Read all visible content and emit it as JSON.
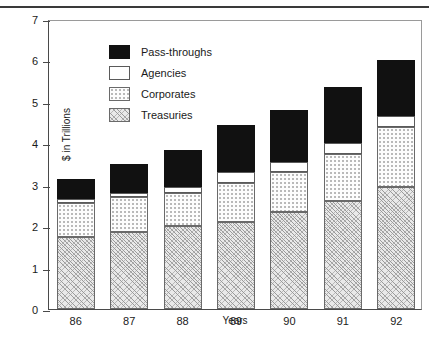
{
  "chart_data": {
    "type": "bar",
    "subtype": "stacked-bar",
    "title": "",
    "xlabel": "Years",
    "ylabel": "$ in Trillions",
    "categories": [
      "86",
      "87",
      "88",
      "89",
      "90",
      "91",
      "92"
    ],
    "ylim": [
      0,
      7
    ],
    "yticks": [
      0,
      1,
      2,
      3,
      4,
      5,
      6,
      7
    ],
    "ytick_labels": [
      "0",
      "1",
      "2",
      "3",
      "4",
      "5",
      "6",
      "7"
    ],
    "grid": false,
    "legend_position": "upper-left-inside",
    "stack_order_bottom_to_top": [
      "Treasuries",
      "Corporates",
      "Agencies",
      "Pass-throughs"
    ],
    "series": [
      {
        "name": "Treasuries",
        "fill": "diagonal-hatch",
        "color": "#e9e9e9",
        "values": [
          1.75,
          1.85,
          2.0,
          2.1,
          2.35,
          2.6,
          2.95
        ]
      },
      {
        "name": "Corporates",
        "fill": "light-dotted",
        "color": "#fdfdfd",
        "values": [
          0.8,
          0.85,
          0.8,
          0.95,
          0.95,
          1.15,
          1.45
        ]
      },
      {
        "name": "Agencies",
        "fill": "solid-white",
        "color": "#ffffff",
        "values": [
          0.1,
          0.1,
          0.15,
          0.25,
          0.25,
          0.25,
          0.25
        ]
      },
      {
        "name": "Pass-throughs",
        "fill": "solid-black",
        "color": "#111111",
        "values": [
          0.5,
          0.7,
          0.9,
          1.15,
          1.25,
          1.35,
          1.35
        ]
      }
    ],
    "totals": [
      3.15,
      3.5,
      3.85,
      4.45,
      4.8,
      5.35,
      6.0
    ]
  },
  "legend": {
    "items": [
      {
        "label": "Pass-throughs",
        "swatch": "solid-black"
      },
      {
        "label": "Agencies",
        "swatch": "solid-white"
      },
      {
        "label": "Corporates",
        "swatch": "light-dotted"
      },
      {
        "label": "Treasuries",
        "swatch": "diagonal-hatch"
      }
    ]
  }
}
